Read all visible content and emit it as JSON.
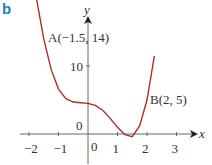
{
  "figure_label": "b",
  "chart_data": {
    "type": "line",
    "title": "",
    "xlabel": "x",
    "ylabel": "y",
    "xlim": [
      -2.1,
      3.4
    ],
    "ylim": [
      -1,
      20
    ],
    "grid": false,
    "x_ticks": [
      -2,
      -1,
      0,
      1,
      2,
      3
    ],
    "x_tick_labels": [
      "−2",
      "−1",
      "0",
      "1",
      "2",
      "3"
    ],
    "y_ticks": [
      0,
      10
    ],
    "y_tick_labels": [
      "0",
      "10"
    ],
    "series": [
      {
        "name": "curve",
        "color": "#a8322a",
        "x": [
          -1.75,
          -1.5,
          -1.25,
          -1.0,
          -0.75,
          -0.5,
          -0.25,
          0,
          0.25,
          0.5,
          0.75,
          1.0,
          1.25,
          1.5,
          1.75,
          2.0,
          2.25
        ],
        "y": [
          20,
          14,
          9.5,
          6.6,
          5.2,
          4.7,
          4.6,
          4.5,
          4.2,
          3.5,
          2.3,
          1.0,
          -0.1,
          -0.4,
          1.2,
          5,
          11.5
        ]
      }
    ],
    "annotations": [
      {
        "text": "A(−1.5, 14)",
        "x": -1.5,
        "y": 14
      },
      {
        "text": "B(2, 5)",
        "x": 2,
        "y": 5
      }
    ]
  }
}
